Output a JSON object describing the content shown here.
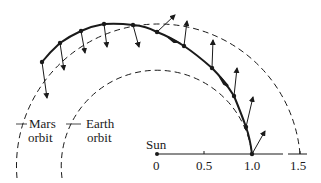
{
  "diagram": {
    "labels": {
      "mars_orbit_line1": "Mars",
      "mars_orbit_line2": "orbit",
      "earth_orbit_line1": "Earth",
      "earth_orbit_line2": "orbit",
      "sun": "Sun"
    },
    "axis": {
      "ticks": [
        "0",
        "0.5",
        "1.0",
        "1.5"
      ],
      "tick_values": [
        0,
        0.5,
        1.0,
        1.5
      ]
    },
    "orbits": [
      {
        "name": "Earth orbit",
        "radius": 1.0,
        "style": "dashed"
      },
      {
        "name": "Mars orbit",
        "radius": 1.5,
        "style": "dashed"
      }
    ],
    "colors": {
      "ink": "#1a1a1a",
      "background": "#ffffff"
    }
  }
}
